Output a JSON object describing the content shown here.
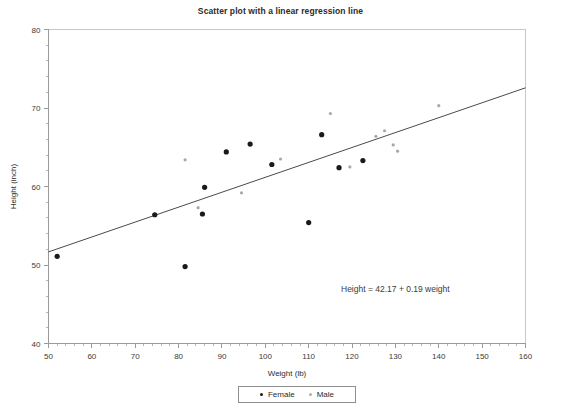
{
  "chart_data": {
    "type": "scatter",
    "title": "Scatter plot with a linear regression line",
    "xlabel": "Weight (lb)",
    "ylabel": "Height (inch)",
    "xlim": [
      50,
      160
    ],
    "ylim": [
      40,
      80
    ],
    "xticks": [
      50,
      60,
      70,
      80,
      90,
      100,
      110,
      120,
      130,
      140,
      150,
      160
    ],
    "yticks": [
      40,
      50,
      60,
      70,
      80
    ],
    "x_minor_interval": 2,
    "y_minor_interval": 2,
    "grid": false,
    "legend_position": "below-axis-center",
    "annotation": "Height = 42.17 + 0.19 weight",
    "regression": {
      "intercept": 42.17,
      "slope": 0.19,
      "x_start": 50,
      "x_end": 160,
      "y_start": 51.67,
      "y_end": 72.57,
      "color": "#4a4a4a"
    },
    "series": [
      {
        "name": "Female",
        "marker": "filled-circle",
        "color": "#1a1a1a",
        "points": [
          {
            "x": 52.0,
            "y": 51.1
          },
          {
            "x": 74.5,
            "y": 56.4
          },
          {
            "x": 81.5,
            "y": 49.8
          },
          {
            "x": 85.5,
            "y": 56.5
          },
          {
            "x": 86.0,
            "y": 59.9
          },
          {
            "x": 91.0,
            "y": 64.4
          },
          {
            "x": 96.5,
            "y": 65.4
          },
          {
            "x": 101.5,
            "y": 62.8
          },
          {
            "x": 110.0,
            "y": 55.4
          },
          {
            "x": 113.0,
            "y": 66.6
          },
          {
            "x": 117.0,
            "y": 62.4
          },
          {
            "x": 122.5,
            "y": 63.3
          }
        ]
      },
      {
        "name": "Male",
        "marker": "small-circle",
        "color": "#a8a8a8",
        "points": [
          {
            "x": 81.5,
            "y": 63.4
          },
          {
            "x": 84.5,
            "y": 57.3
          },
          {
            "x": 94.5,
            "y": 59.2
          },
          {
            "x": 103.5,
            "y": 63.5
          },
          {
            "x": 115.0,
            "y": 69.3
          },
          {
            "x": 119.5,
            "y": 62.5
          },
          {
            "x": 125.5,
            "y": 66.4
          },
          {
            "x": 127.5,
            "y": 67.1
          },
          {
            "x": 129.5,
            "y": 65.3
          },
          {
            "x": 130.5,
            "y": 64.5
          },
          {
            "x": 140.0,
            "y": 70.3
          }
        ]
      }
    ]
  },
  "legend": {
    "items": [
      {
        "label": "Female"
      },
      {
        "label": "Male"
      }
    ]
  },
  "colors": {
    "female": "#1a1a1a",
    "male": "#a8a8a8",
    "axis": "#9a9a9a",
    "line": "#4a4a4a",
    "text": "#2b2b2b"
  }
}
